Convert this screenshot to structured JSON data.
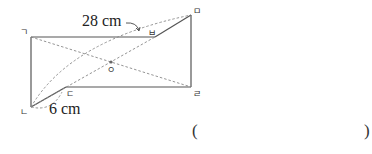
{
  "diagram": {
    "type": "geometry-figure",
    "points": {
      "giyeok": {
        "label": "ㄱ",
        "x": 31,
        "y": 37
      },
      "nieun": {
        "label": "ㄴ",
        "x": 31,
        "y": 107
      },
      "digeut": {
        "label": "ㄷ",
        "x": 66,
        "y": 87
      },
      "rieul": {
        "label": "ㄹ",
        "x": 191,
        "y": 87
      },
      "mieum": {
        "label": "ㅁ",
        "x": 191,
        "y": 15
      },
      "bieup": {
        "label": "ㅂ",
        "x": 155,
        "y": 37
      },
      "center": {
        "label": "ㅇ",
        "x": 111,
        "y": 62
      }
    },
    "measurements": {
      "diagonal_length": "28 cm",
      "short_segment": "6 cm"
    },
    "answer_blank": {
      "open": "(",
      "close": ")"
    },
    "colors": {
      "line": "#555555",
      "dashed": "#888888",
      "text": "#222222"
    }
  }
}
